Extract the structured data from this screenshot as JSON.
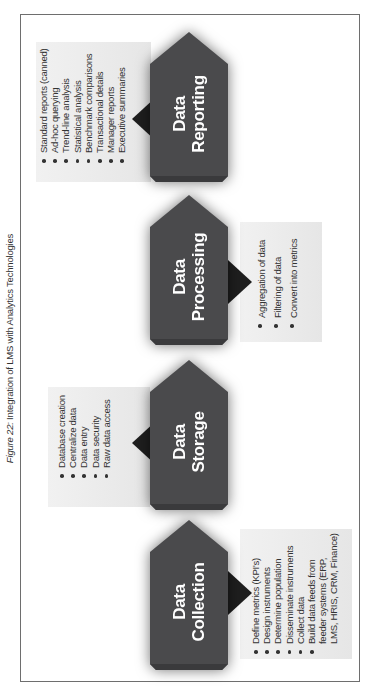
{
  "caption": {
    "figure_label": "Figure 22:",
    "title": "Integration of LMS with Analytics Technologies"
  },
  "colors": {
    "shape_fill": "#4a4a4c",
    "shape_edge": "#3a3a3c",
    "pointer_fill": "#1e1e1e",
    "band_fill": "#ececec",
    "frame_border": "#6e6e6e"
  },
  "stages": [
    {
      "id": "collection",
      "title_line1": "Data",
      "title_line2": "Collection",
      "items": [
        "Define metrics (KPI's)",
        "Design instruments",
        "Determine population",
        "Disseminate instruments",
        "Collect data",
        "Build data feeds from",
        "feeder systems (ERP,",
        "LMS, HRIS, CRM, Finance)"
      ]
    },
    {
      "id": "storage",
      "title_line1": "Data",
      "title_line2": "Storage",
      "items": [
        "Database creation",
        "Centralize data",
        "Data entry",
        "Data security",
        "Raw data access"
      ]
    },
    {
      "id": "processing",
      "title_line1": "Data",
      "title_line2": "Processing",
      "items": [
        "Aggregation of data",
        "Filtering of data",
        "Convert into metrics"
      ]
    },
    {
      "id": "reporting",
      "title_line1": "Data",
      "title_line2": "Reporting",
      "items": [
        "Standard reports (canned)",
        "Ad-hoc querying",
        "Trend-line analysis",
        "Statistical analysis",
        "Benchmark comparisons",
        "Transactional details",
        "Manager reports",
        "Executive summaries"
      ]
    }
  ]
}
